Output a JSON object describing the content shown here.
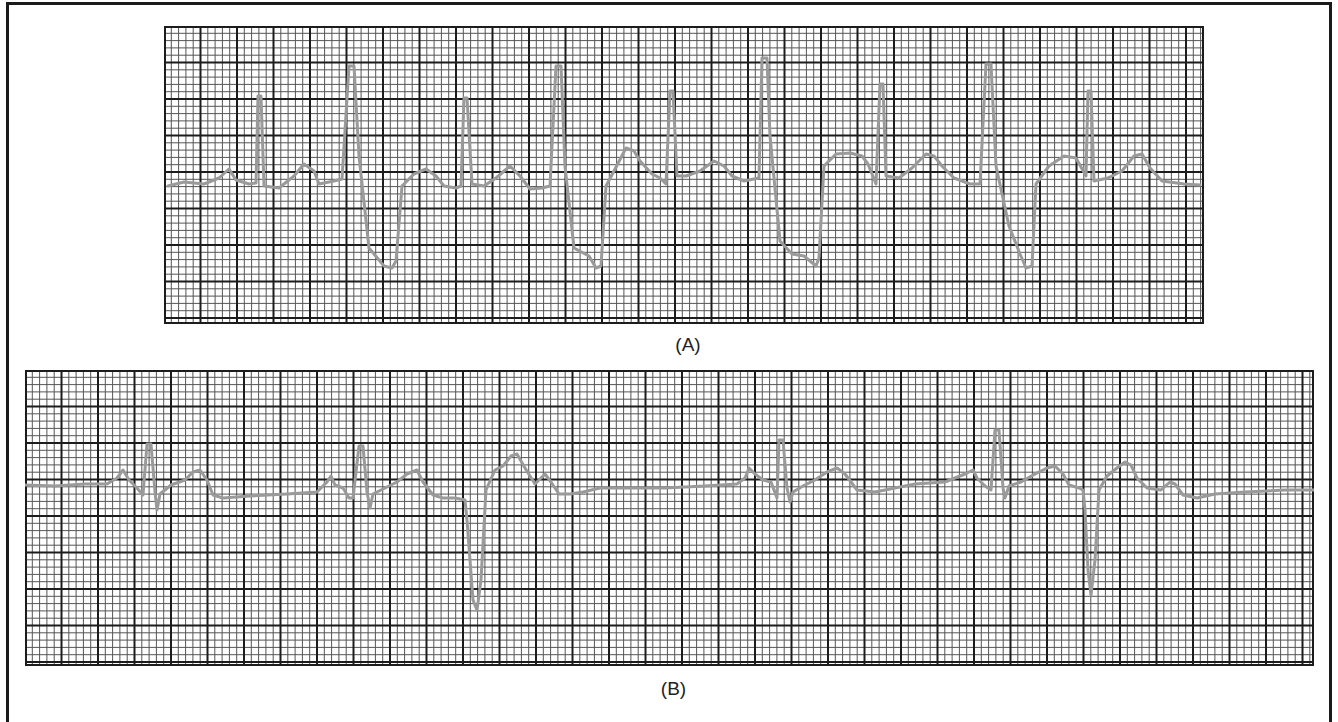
{
  "figure": {
    "strips": [
      {
        "id": "A",
        "label": "(A)",
        "x": 164,
        "y": 26,
        "width": 1040,
        "height": 298,
        "major_px": 36.5,
        "minor_per_major": 5,
        "baseline_y": 160,
        "trace_points": [
          [
            4,
            160
          ],
          [
            20,
            156
          ],
          [
            40,
            158
          ],
          [
            55,
            152
          ],
          [
            65,
            143
          ],
          [
            72,
            154
          ],
          [
            85,
            158
          ],
          [
            92,
            157
          ],
          [
            94,
            70
          ],
          [
            97,
            70
          ],
          [
            100,
            160
          ],
          [
            115,
            162
          ],
          [
            130,
            150
          ],
          [
            140,
            138
          ],
          [
            150,
            145
          ],
          [
            155,
            158
          ],
          [
            170,
            155
          ],
          [
            178,
            153
          ],
          [
            185,
            40
          ],
          [
            190,
            40
          ],
          [
            195,
            130
          ],
          [
            205,
            222
          ],
          [
            220,
            240
          ],
          [
            228,
            242
          ],
          [
            232,
            235
          ],
          [
            238,
            160
          ],
          [
            250,
            148
          ],
          [
            262,
            143
          ],
          [
            272,
            150
          ],
          [
            280,
            160
          ],
          [
            292,
            162
          ],
          [
            297,
            160
          ],
          [
            300,
            72
          ],
          [
            303,
            72
          ],
          [
            308,
            158
          ],
          [
            320,
            160
          ],
          [
            332,
            152
          ],
          [
            346,
            140
          ],
          [
            356,
            150
          ],
          [
            366,
            163
          ],
          [
            378,
            162
          ],
          [
            386,
            160
          ],
          [
            392,
            40
          ],
          [
            397,
            40
          ],
          [
            401,
            140
          ],
          [
            410,
            222
          ],
          [
            425,
            230
          ],
          [
            432,
            242
          ],
          [
            437,
            240
          ],
          [
            442,
            160
          ],
          [
            450,
            145
          ],
          [
            462,
            122
          ],
          [
            470,
            125
          ],
          [
            476,
            135
          ],
          [
            488,
            148
          ],
          [
            496,
            152
          ],
          [
            502,
            158
          ],
          [
            506,
            65
          ],
          [
            509,
            65
          ],
          [
            513,
            150
          ],
          [
            522,
            150
          ],
          [
            536,
            145
          ],
          [
            550,
            135
          ],
          [
            560,
            140
          ],
          [
            568,
            150
          ],
          [
            580,
            155
          ],
          [
            595,
            152
          ],
          [
            598,
            32
          ],
          [
            603,
            32
          ],
          [
            606,
            110
          ],
          [
            616,
            215
          ],
          [
            628,
            228
          ],
          [
            640,
            230
          ],
          [
            652,
            240
          ],
          [
            655,
            232
          ],
          [
            660,
            140
          ],
          [
            672,
            128
          ],
          [
            686,
            127
          ],
          [
            698,
            130
          ],
          [
            704,
            138
          ],
          [
            712,
            158
          ],
          [
            716,
            58
          ],
          [
            719,
            58
          ],
          [
            722,
            150
          ],
          [
            735,
            152
          ],
          [
            748,
            142
          ],
          [
            762,
            128
          ],
          [
            770,
            130
          ],
          [
            778,
            140
          ],
          [
            790,
            152
          ],
          [
            806,
            158
          ],
          [
            816,
            158
          ],
          [
            822,
            38
          ],
          [
            827,
            38
          ],
          [
            832,
            140
          ],
          [
            845,
            200
          ],
          [
            856,
            228
          ],
          [
            862,
            242
          ],
          [
            868,
            240
          ],
          [
            872,
            158
          ],
          [
            885,
            140
          ],
          [
            900,
            130
          ],
          [
            912,
            132
          ],
          [
            922,
            150
          ],
          [
            924,
            65
          ],
          [
            927,
            65
          ],
          [
            930,
            155
          ],
          [
            944,
            152
          ],
          [
            958,
            145
          ],
          [
            970,
            130
          ],
          [
            978,
            128
          ],
          [
            986,
            142
          ],
          [
            998,
            155
          ],
          [
            1020,
            158
          ],
          [
            1036,
            159
          ]
        ]
      },
      {
        "id": "B",
        "label": "(B)",
        "x": 25,
        "y": 370,
        "width": 1289,
        "height": 296,
        "major_px": 36.5,
        "minor_per_major": 5,
        "baseline_y": 114,
        "trace_points": [
          [
            0,
            115
          ],
          [
            30,
            116
          ],
          [
            60,
            114
          ],
          [
            82,
            114
          ],
          [
            92,
            108
          ],
          [
            98,
            100
          ],
          [
            104,
            110
          ],
          [
            112,
            118
          ],
          [
            118,
            125
          ],
          [
            122,
            74
          ],
          [
            126,
            74
          ],
          [
            130,
            122
          ],
          [
            132,
            140
          ],
          [
            135,
            124
          ],
          [
            146,
            115
          ],
          [
            160,
            110
          ],
          [
            168,
            102
          ],
          [
            175,
            100
          ],
          [
            182,
            110
          ],
          [
            188,
            125
          ],
          [
            198,
            128
          ],
          [
            225,
            126
          ],
          [
            262,
            124
          ],
          [
            292,
            122
          ],
          [
            302,
            112
          ],
          [
            306,
            106
          ],
          [
            310,
            115
          ],
          [
            318,
            118
          ],
          [
            324,
            128
          ],
          [
            328,
            128
          ],
          [
            334,
            76
          ],
          [
            338,
            76
          ],
          [
            342,
            122
          ],
          [
            345,
            138
          ],
          [
            348,
            124
          ],
          [
            360,
            118
          ],
          [
            372,
            112
          ],
          [
            382,
            104
          ],
          [
            392,
            100
          ],
          [
            398,
            112
          ],
          [
            408,
            125
          ],
          [
            418,
            128
          ],
          [
            430,
            128
          ],
          [
            440,
            130
          ],
          [
            442,
            150
          ],
          [
            448,
            230
          ],
          [
            452,
            240
          ],
          [
            456,
            210
          ],
          [
            461,
            120
          ],
          [
            470,
            100
          ],
          [
            478,
            96
          ],
          [
            486,
            86
          ],
          [
            492,
            84
          ],
          [
            500,
            98
          ],
          [
            510,
            114
          ],
          [
            520,
            104
          ],
          [
            526,
            112
          ],
          [
            534,
            124
          ],
          [
            545,
            124
          ],
          [
            558,
            122
          ],
          [
            575,
            118
          ],
          [
            598,
            118
          ],
          [
            640,
            118
          ],
          [
            680,
            116
          ],
          [
            712,
            114
          ],
          [
            720,
            108
          ],
          [
            724,
            98
          ],
          [
            730,
            104
          ],
          [
            738,
            110
          ],
          [
            746,
            112
          ],
          [
            752,
            128
          ],
          [
            754,
            70
          ],
          [
            758,
            70
          ],
          [
            762,
            118
          ],
          [
            765,
            132
          ],
          [
            768,
            122
          ],
          [
            778,
            116
          ],
          [
            790,
            110
          ],
          [
            802,
            102
          ],
          [
            812,
            98
          ],
          [
            820,
            104
          ],
          [
            832,
            120
          ],
          [
            850,
            122
          ],
          [
            870,
            118
          ],
          [
            890,
            114
          ],
          [
            920,
            112
          ],
          [
            940,
            104
          ],
          [
            948,
            100
          ],
          [
            952,
            108
          ],
          [
            960,
            116
          ],
          [
            966,
            120
          ],
          [
            970,
            60
          ],
          [
            974,
            60
          ],
          [
            978,
            118
          ],
          [
            980,
            128
          ],
          [
            984,
            116
          ],
          [
            996,
            112
          ],
          [
            1010,
            104
          ],
          [
            1022,
            98
          ],
          [
            1030,
            96
          ],
          [
            1038,
            104
          ],
          [
            1044,
            115
          ],
          [
            1054,
            118
          ],
          [
            1058,
            120
          ],
          [
            1060,
            140
          ],
          [
            1063,
            200
          ],
          [
            1066,
            225
          ],
          [
            1070,
            190
          ],
          [
            1074,
            120
          ],
          [
            1082,
            106
          ],
          [
            1092,
            98
          ],
          [
            1100,
            92
          ],
          [
            1106,
            95
          ],
          [
            1112,
            108
          ],
          [
            1122,
            118
          ],
          [
            1136,
            120
          ],
          [
            1145,
            112
          ],
          [
            1150,
            114
          ],
          [
            1158,
            125
          ],
          [
            1172,
            128
          ],
          [
            1190,
            124
          ],
          [
            1220,
            122
          ],
          [
            1260,
            120
          ],
          [
            1289,
            120
          ]
        ]
      }
    ]
  },
  "colors": {
    "major_grid": "#1c1c1c",
    "minor_grid": "#555555",
    "trace": "#9a9a9a",
    "frame": "#1a1a1a"
  }
}
